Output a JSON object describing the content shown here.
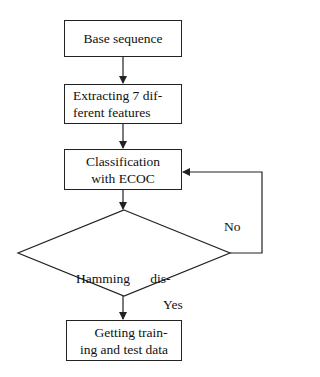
{
  "diagram": {
    "type": "flowchart",
    "nodes": [
      {
        "id": "base",
        "shape": "rect",
        "lines": [
          "Base sequence"
        ]
      },
      {
        "id": "extract",
        "shape": "rect",
        "lines": [
          "Extracting 7 dif-",
          "ferent features"
        ]
      },
      {
        "id": "classify",
        "shape": "rect",
        "lines": [
          "Classification",
          "with ECOC"
        ]
      },
      {
        "id": "decision",
        "shape": "diamond",
        "lines": [
          "Hamming      dis-",
          "tance is large?"
        ]
      },
      {
        "id": "output",
        "shape": "rect",
        "lines": [
          "Getting train-",
          "ing and test data"
        ]
      }
    ],
    "edges": [
      {
        "from": "base",
        "to": "extract",
        "label": ""
      },
      {
        "from": "extract",
        "to": "classify",
        "label": ""
      },
      {
        "from": "classify",
        "to": "decision",
        "label": ""
      },
      {
        "from": "decision",
        "to": "output",
        "label": "Yes"
      },
      {
        "from": "decision",
        "to": "classify",
        "label": "No"
      }
    ],
    "labels": {
      "yes": "Yes",
      "no": "No"
    },
    "colors": {
      "stroke": "#222222",
      "background": "#ffffff",
      "text": "#111111"
    }
  }
}
